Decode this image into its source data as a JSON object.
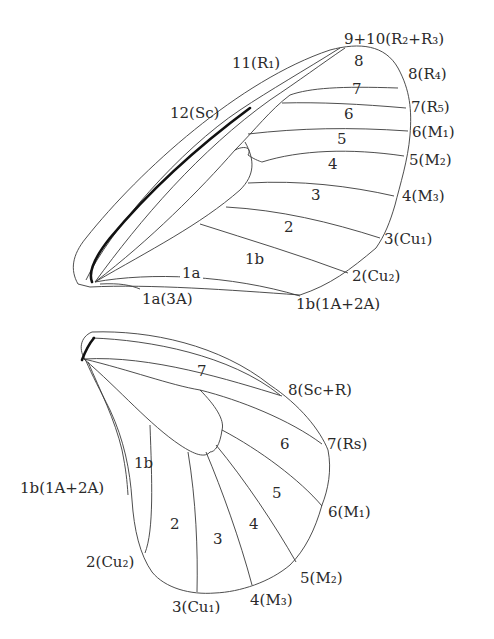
{
  "figure": {
    "colors": {
      "line": "#3a3a3a",
      "thick_vein": "#111111",
      "text": "#2a2a2a",
      "background": "#ffffff"
    }
  },
  "forewing": {
    "vein_labels": [
      {
        "id": "9+10",
        "text": "9+10(R₂+R₃)"
      },
      {
        "id": "11",
        "text": "11(R₁)"
      },
      {
        "id": "12",
        "text": "12(Sc)"
      },
      {
        "id": "8",
        "text": "8(R₄)"
      },
      {
        "id": "7",
        "text": "7(R₅)"
      },
      {
        "id": "6",
        "text": "6(M₁)"
      },
      {
        "id": "5",
        "text": "5(M₂)"
      },
      {
        "id": "4",
        "text": "4(M₃)"
      },
      {
        "id": "3",
        "text": "3(Cu₁)"
      },
      {
        "id": "2",
        "text": "2(Cu₂)"
      },
      {
        "id": "1b",
        "text": "1b(1A+2A)"
      },
      {
        "id": "1a",
        "text": "1a(3A)"
      }
    ],
    "cell_labels": [
      "8",
      "7",
      "6",
      "5",
      "4",
      "3",
      "2",
      "1b",
      "1a"
    ]
  },
  "hindwing": {
    "vein_labels": [
      {
        "id": "8",
        "text": "8(Sc+R)"
      },
      {
        "id": "7",
        "text": "7(Rs)"
      },
      {
        "id": "6",
        "text": "6(M₁)"
      },
      {
        "id": "5",
        "text": "5(M₂)"
      },
      {
        "id": "4",
        "text": "4(M₃)"
      },
      {
        "id": "3",
        "text": "3(Cu₁)"
      },
      {
        "id": "2",
        "text": "2(Cu₂)"
      },
      {
        "id": "1b",
        "text": "1b(1A+2A)"
      }
    ],
    "cell_labels": [
      "7",
      "6",
      "5",
      "4",
      "3",
      "2",
      "1b"
    ]
  }
}
